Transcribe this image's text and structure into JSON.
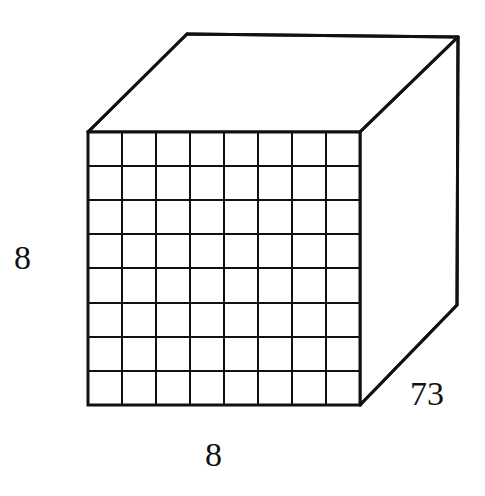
{
  "figure": {
    "kind": "3d-cube-with-unit-grid",
    "background_color": "#ffffff",
    "stroke_color": "#111111",
    "face_fill": "#ffffff",
    "grid": {
      "columns": 8,
      "rows": 8,
      "cell_size_px": 34,
      "grid_line_width_px": 2,
      "outline_width_px": 3
    },
    "geometry": {
      "front_face": {
        "top_left": [
          88,
          132
        ],
        "top_right": [
          360,
          132
        ],
        "bottom_right": [
          360,
          405
        ],
        "bottom_left": [
          88,
          405
        ]
      },
      "back_top_left": [
        187,
        34
      ],
      "back_top_right": [
        458,
        37
      ],
      "back_bottom_right": [
        457,
        305
      ]
    }
  },
  "labels": {
    "height": {
      "text": "8",
      "position": "left",
      "x": 30,
      "y": 260
    },
    "width": {
      "text": "8",
      "position": "bottom",
      "x": 218,
      "y": 458
    },
    "depth": {
      "text": "73",
      "position": "right",
      "x": 439,
      "y": 397
    }
  }
}
